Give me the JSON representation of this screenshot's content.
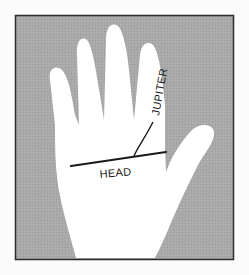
{
  "figure": {
    "colors": {
      "page": "#fbfbfb",
      "frame_border": "#2b2b2b",
      "background_fill": "#a9a9a9",
      "hand_fill": "#ffffff",
      "line_color": "#1a1a1a"
    },
    "labels": {
      "jupiter": "JUPITER",
      "head": "HEAD"
    }
  }
}
